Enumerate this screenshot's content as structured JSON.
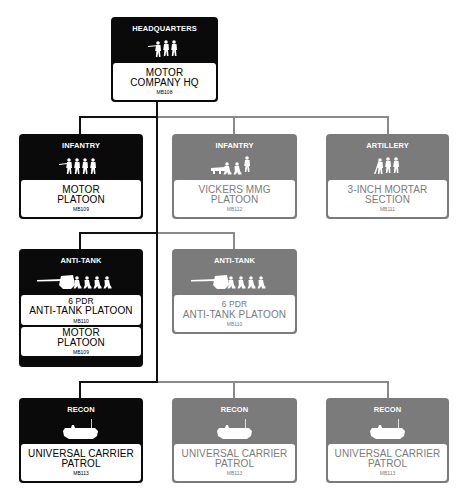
{
  "colors": {
    "selected_fill": "#0a0a0a",
    "optional_fill": "#7b7b7b",
    "label_fill": "#ffffff",
    "connector_selected": "#111111",
    "connector_optional": "#8a8a8a"
  },
  "hq": {
    "type": "HEADQUARTERS",
    "icon": "infantry-group-icon",
    "name_line1": "MOTOR",
    "name_line2": "COMPANY HQ",
    "code": "MB108"
  },
  "row2": [
    {
      "type": "INFANTRY",
      "icon": "infantry-squad-icon",
      "name_line1": "MOTOR",
      "name_line2": "PLATOON",
      "code": "MB109",
      "status": "selected"
    },
    {
      "type": "INFANTRY",
      "icon": "machine-gun-team-icon",
      "name_line1": "VICKERS MMG",
      "name_line2": "PLATOON",
      "code": "MB112",
      "status": "optional"
    },
    {
      "type": "ARTILLERY",
      "icon": "mortar-team-icon",
      "name_line1": "3-INCH MORTAR",
      "name_line2": "SECTION",
      "code": "MB111",
      "status": "optional"
    }
  ],
  "row3": [
    {
      "type": "ANTI-TANK",
      "icon": "anti-tank-gun-icon",
      "name_line1": "6 PDR",
      "name_line2": "ANTI-TANK PLATOON",
      "code": "MB110",
      "extra": {
        "name_line1": "MOTOR",
        "name_line2": "PLATOON",
        "code": "MB109"
      },
      "status": "selected"
    },
    {
      "type": "ANTI-TANK",
      "icon": "anti-tank-gun-icon",
      "name_line1": "6 PDR",
      "name_line2": "ANTI-TANK PLATOON",
      "code": "MB110",
      "status": "optional"
    }
  ],
  "row4": [
    {
      "type": "RECON",
      "icon": "universal-carrier-icon",
      "name_line1": "UNIVERSAL CARRIER",
      "name_line2": "PATROL",
      "code": "MB113",
      "status": "selected"
    },
    {
      "type": "RECON",
      "icon": "universal-carrier-icon",
      "name_line1": "UNIVERSAL CARRIER",
      "name_line2": "PATROL",
      "code": "MB113",
      "status": "optional"
    },
    {
      "type": "RECON",
      "icon": "universal-carrier-icon",
      "name_line1": "UNIVERSAL CARRIER",
      "name_line2": "PATROL",
      "code": "MB113",
      "status": "optional"
    }
  ]
}
